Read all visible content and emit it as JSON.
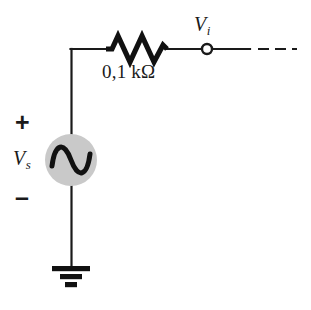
{
  "diagram": {
    "background_color": "#ffffff",
    "wire_color": "#1a1a1a",
    "source_fill_color": "#c9c9c9",
    "source_stroke_color": "#1a1a1a"
  },
  "labels": {
    "source_symbol": "V",
    "source_subscript": "s",
    "node_symbol": "V",
    "node_subscript": "i",
    "polarity_plus": "+",
    "polarity_minus": "–",
    "resistance": "0,1 kΩ"
  },
  "components": {
    "voltage_source": {
      "name": "ac-voltage-source",
      "kind": "ac-sine-source",
      "center_x": 71,
      "center_y": 160,
      "radius": 26
    },
    "resistor": {
      "name": "series-resistor",
      "kind": "zigzag-resistor",
      "value": "0,1 kΩ",
      "x_start": 105,
      "x_end": 168,
      "y": 49,
      "peaks": 3
    },
    "ground": {
      "name": "ground-symbol",
      "kind": "earth-ground",
      "x": 71,
      "y_top": 266,
      "bar_widths": [
        38,
        22,
        12
      ]
    },
    "output_node": {
      "name": "output-node-vi",
      "kind": "open-terminal",
      "x": 207,
      "y": 49,
      "radius": 5
    },
    "dashed_continuation": {
      "name": "dashed-wire-continuation",
      "x_start": 250,
      "x_end": 296,
      "y": 49,
      "dash_count": 3
    }
  },
  "wires": {
    "vertical_left": {
      "x": 71,
      "y_top": 48,
      "y_bottom": 266
    },
    "top_horizontal": {
      "y": 49,
      "x_start": 71,
      "x_end": 250
    }
  }
}
